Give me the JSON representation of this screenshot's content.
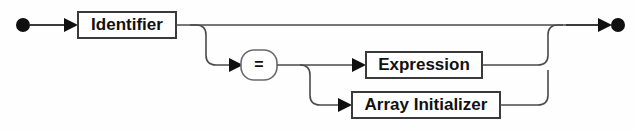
{
  "diagram": {
    "kind": "railroad-syntax-diagram",
    "background_color": "#fefefe",
    "line_color": "#3a3a3a",
    "text_color": "#111111",
    "start_marker": "filled-circle",
    "end_marker": "arrow-then-filled-circle",
    "nodes": [
      {
        "id": "identifier",
        "label": "Identifier",
        "shape": "rectangle",
        "type": "nonterminal",
        "x": 78,
        "y": 12,
        "w": 98,
        "h": 26,
        "cx": 127,
        "cy": 25
      },
      {
        "id": "equals",
        "label": "=",
        "shape": "rounded",
        "type": "terminal",
        "x": 241,
        "y": 50,
        "w": 36,
        "h": 30,
        "cx": 259,
        "cy": 65
      },
      {
        "id": "expression",
        "label": "Expression",
        "shape": "rectangle",
        "type": "nonterminal",
        "x": 366,
        "y": 52,
        "w": 116,
        "h": 26,
        "cx": 424,
        "cy": 65
      },
      {
        "id": "array-initializer",
        "label": "Array Initializer",
        "shape": "rectangle",
        "type": "nonterminal",
        "x": 352,
        "y": 92,
        "w": 148,
        "h": 26,
        "cx": 426,
        "cy": 105
      }
    ],
    "branches": [
      {
        "id": "bypass-assignment",
        "from": "identifier",
        "to": "end",
        "optional": true
      },
      {
        "id": "to-equals",
        "from": "identifier",
        "to": "equals"
      },
      {
        "id": "equals-to-expression",
        "from": "equals",
        "to": "expression"
      },
      {
        "id": "equals-to-array-initializer",
        "from": "equals",
        "to": "array-initializer"
      },
      {
        "id": "expression-to-end",
        "from": "expression",
        "to": "end"
      },
      {
        "id": "array-initializer-to-end",
        "from": "array-initializer",
        "to": "end"
      }
    ],
    "arrow_markers": [
      {
        "id": "arrow-into-identifier",
        "x": 72,
        "y": 25
      },
      {
        "id": "arrow-into-equals",
        "x": 237,
        "y": 65
      },
      {
        "id": "arrow-into-expression",
        "x": 360,
        "y": 65
      },
      {
        "id": "arrow-into-array-initializer",
        "x": 346,
        "y": 105
      },
      {
        "id": "arrow-into-end",
        "x": 606,
        "y": 25
      }
    ],
    "terminals": {
      "start": {
        "cx": 23,
        "cy": 25,
        "r": 7
      },
      "end": {
        "cx": 617,
        "cy": 25,
        "r": 7
      }
    }
  }
}
